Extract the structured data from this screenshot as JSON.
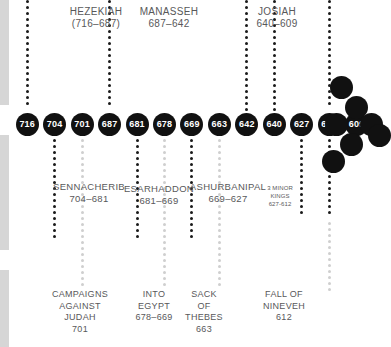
{
  "figure": {
    "kind": "historical-timeline",
    "accent_dark": "#111111",
    "accent_light": "#cfcfcf",
    "text_color": "#58585a",
    "edge_bar_color": "#d6d6d6"
  },
  "timeline": {
    "dates": [
      "716",
      "704",
      "701",
      "687",
      "681",
      "678",
      "669",
      "663",
      "642",
      "640",
      "627",
      "612",
      "609"
    ]
  },
  "judah_kings": [
    {
      "name": "HEZEKIAH",
      "reign": "(716–687)"
    },
    {
      "name": "MANASSEH",
      "reign": "687–642"
    },
    {
      "name": "JOSIAH",
      "reign": "640–609"
    }
  ],
  "assyrian_kings": [
    {
      "name": "SENNACHERIB",
      "reign": "704–681"
    },
    {
      "name": "ESARHADDON",
      "reign": "681–669"
    },
    {
      "name": "ASHURBANIPAL",
      "reign": "669–627"
    }
  ],
  "minor_kings": {
    "line1": "3 MINOR",
    "line2": "KINGS",
    "line3": "627-612"
  },
  "events": [
    {
      "l1": "CAMPAIGNS",
      "l2": "AGAINST",
      "l3": "JUDAH",
      "l4": "701"
    },
    {
      "l1": "INTO",
      "l2": "EGYPT",
      "l3": "678–669",
      "l4": ""
    },
    {
      "l1": "SACK",
      "l2": "OF",
      "l3": "THEBES",
      "l4": "663"
    },
    {
      "l1": "FALL OF",
      "l2": "NINEVEH",
      "l3": "612",
      "l4": ""
    }
  ]
}
